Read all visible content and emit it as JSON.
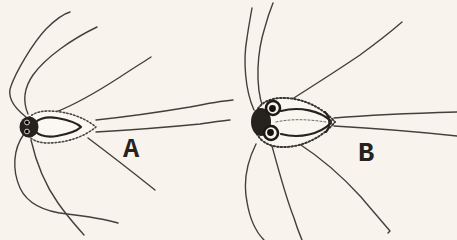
{
  "figure": {
    "background_color": "#f8f4ed",
    "ink_color": "#26231f",
    "panels": [
      {
        "label": "A"
      },
      {
        "label": "B"
      }
    ]
  }
}
